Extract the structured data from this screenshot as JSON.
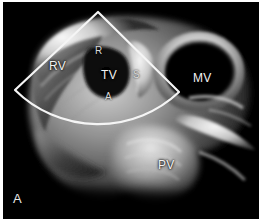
{
  "figure": {
    "panel_label": "A",
    "background_color": "#000000",
    "border_color": "#ffffff",
    "overlay_color": "#f5f5f5"
  },
  "labels": [
    {
      "id": "rv",
      "text": "RV",
      "meaning": "right ventricle",
      "x": 46,
      "y": 58,
      "size": "normal"
    },
    {
      "id": "r",
      "text": "R",
      "meaning": "right coronary leaflet",
      "x": 92,
      "y": 44,
      "size": "small"
    },
    {
      "id": "tv",
      "text": "TV",
      "meaning": "tricuspid valve",
      "x": 98,
      "y": 67,
      "size": "normal"
    },
    {
      "id": "s",
      "text": "S",
      "meaning": "septal leaflet",
      "x": 130,
      "y": 68,
      "size": "small"
    },
    {
      "id": "a",
      "text": "A",
      "meaning": "anterior leaflet",
      "x": 102,
      "y": 90,
      "size": "small"
    },
    {
      "id": "mv",
      "text": "MV",
      "meaning": "mitral valve",
      "x": 190,
      "y": 70,
      "size": "normal"
    },
    {
      "id": "pv",
      "text": "PV",
      "meaning": "pulmonary valve",
      "x": 155,
      "y": 157,
      "size": "normal"
    }
  ],
  "sector_overlay": {
    "name": "ultrasound-scan-sector",
    "apex_x": 95,
    "apex_y": 10,
    "left_corner_x": 12,
    "left_corner_y": 88,
    "arc_end_x": 176,
    "arc_end_y": 90,
    "stroke_width": 2.2
  }
}
